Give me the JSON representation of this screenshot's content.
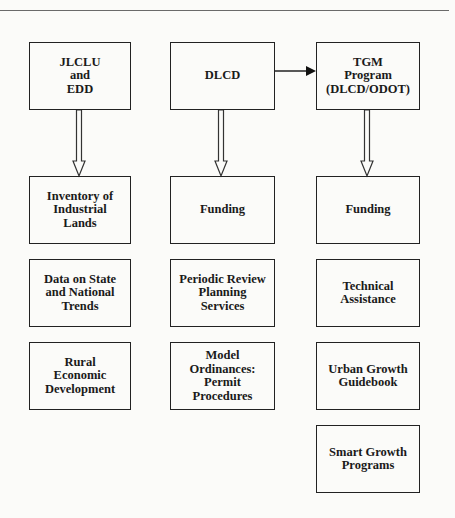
{
  "diagram": {
    "columns": [
      {
        "header": "JLCLU\nand\nEDD",
        "items": [
          "Inventory of\nIndustrial\nLands",
          "Data on State\nand National\nTrends",
          "Rural\nEconomic\nDevelopment"
        ]
      },
      {
        "header": "DLCD",
        "items": [
          "Funding",
          "Periodic Review\nPlanning\nServices",
          "Model\nOrdinances:\nPermit\nProcedures"
        ]
      },
      {
        "header": "TGM\nProgram\n(DLCD/ODOT)",
        "items": [
          "Funding",
          "Technical\nAssistance",
          "Urban Growth\nGuidebook",
          "Smart Growth\nPrograms"
        ]
      }
    ],
    "edges": [
      {
        "from": "DLCD",
        "to": "TGM Program (DLCD/ODOT)",
        "style": "solid-arrow"
      },
      {
        "from": "JLCLU and EDD",
        "to": "Inventory of Industrial Lands",
        "style": "hollow-arrow"
      },
      {
        "from": "DLCD",
        "to": "Funding",
        "style": "hollow-arrow"
      },
      {
        "from": "TGM Program (DLCD/ODOT)",
        "to": "Funding",
        "style": "hollow-arrow"
      }
    ],
    "colors": {
      "line": "#222222",
      "background": "#fbfbf9",
      "rule": "#6a6a6a"
    }
  }
}
